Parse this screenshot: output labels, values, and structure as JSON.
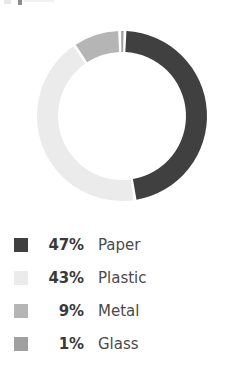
{
  "chart_data": {
    "type": "pie",
    "variant": "donut",
    "title": "",
    "categories": [
      "Paper",
      "Plastic",
      "Metal",
      "Glass"
    ],
    "values": [
      47,
      43,
      9,
      1
    ],
    "unit": "%",
    "colors": [
      "#404040",
      "#ebebeb",
      "#b5b5b5",
      "#a0a0a0"
    ],
    "legend_position": "bottom",
    "grid": false,
    "start_angle_deg": 2,
    "segment_gap_deg": 2,
    "inner_radius_ratio": 0.75,
    "slices": [
      {
        "label": "Paper",
        "value": 47,
        "percent_text": "47%",
        "color": "#404040"
      },
      {
        "label": "Plastic",
        "value": 43,
        "percent_text": "43%",
        "color": "#ebebeb"
      },
      {
        "label": "Metal",
        "value": 9,
        "percent_text": "9%",
        "color": "#b5b5b5"
      },
      {
        "label": "Glass",
        "value": 1,
        "percent_text": "1%",
        "color": "#a0a0a0"
      }
    ]
  },
  "legend": {
    "rows": [
      {
        "percent": "47%",
        "label": "Paper",
        "color": "#404040"
      },
      {
        "percent": "43%",
        "label": "Plastic",
        "color": "#ebebeb"
      },
      {
        "percent": "9%",
        "label": "Metal",
        "color": "#b5b5b5"
      },
      {
        "percent": "1%",
        "label": "Glass",
        "color": "#a0a0a0"
      }
    ]
  },
  "geometry": {
    "center_x": 122,
    "center_y": 108,
    "outer_radius": 85,
    "inner_radius": 64
  }
}
